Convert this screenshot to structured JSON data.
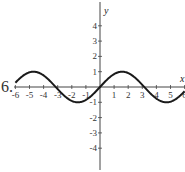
{
  "problem_number": "6.",
  "chart_data": {
    "type": "line",
    "title": "",
    "xlabel": "x",
    "ylabel": "y",
    "xlim": [
      -6,
      6
    ],
    "ylim": [
      -4.6,
      4.6
    ],
    "x_ticks": [
      -6,
      -5,
      -4,
      -3,
      -2,
      -1,
      1,
      2,
      3,
      4,
      5,
      6
    ],
    "y_ticks": [
      -4,
      -3,
      -2,
      -1,
      1,
      2,
      3,
      4
    ],
    "grid": false,
    "series": [
      {
        "name": "y = sin(x)",
        "function": "sin(x)",
        "x": [
          -6,
          -5.5,
          -5,
          -4.71,
          -4.5,
          -4,
          -3.5,
          -3.14,
          -3,
          -2.5,
          -2,
          -1.57,
          -1.5,
          -1,
          -0.5,
          0,
          0.5,
          1,
          1.5,
          1.57,
          2,
          2.5,
          3,
          3.14,
          3.5,
          4,
          4.5,
          4.71,
          5,
          5.5,
          6
        ],
        "values": [
          0.28,
          0.71,
          0.96,
          1.0,
          0.98,
          0.76,
          0.35,
          0.0,
          -0.14,
          -0.6,
          -0.91,
          -1.0,
          -1.0,
          -0.84,
          -0.48,
          0.0,
          0.48,
          0.84,
          1.0,
          1.0,
          0.91,
          0.6,
          0.14,
          0.0,
          -0.35,
          -0.76,
          -0.98,
          -1.0,
          -0.96,
          -0.71,
          -0.28
        ]
      }
    ]
  }
}
